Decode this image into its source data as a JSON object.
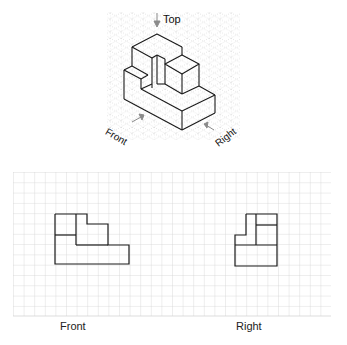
{
  "isometric": {
    "top_label": "Top",
    "front_label": "Front",
    "right_label": "Right"
  },
  "orthographic": {
    "front_label": "Front",
    "right_label": "Right"
  },
  "colors": {
    "grid": "#cfcfcf",
    "iso_grid": "#bdbdbd",
    "outline": "#1a1a1a",
    "arrow": "#8a8a8a"
  }
}
